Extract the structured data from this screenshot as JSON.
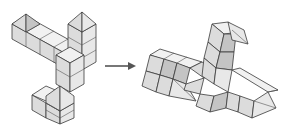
{
  "diagram": {
    "type": "spatial-transformation-puzzle",
    "colors": {
      "background": "#ffffff",
      "cube_top": "#f1f1f1",
      "cube_left": "#dcdcdc",
      "cube_right": "#e8e8e8",
      "cube_shaded": "#c4c4c4",
      "edge": "#3a3a3a",
      "arrow": "#555555"
    },
    "figures": [
      {
        "id": "original",
        "label": "Original block structure",
        "position": "left"
      },
      {
        "id": "transformed",
        "label": "Transformed block structure",
        "position": "right"
      }
    ],
    "arrow": {
      "direction": "right",
      "icon": "right-arrow-icon"
    }
  }
}
